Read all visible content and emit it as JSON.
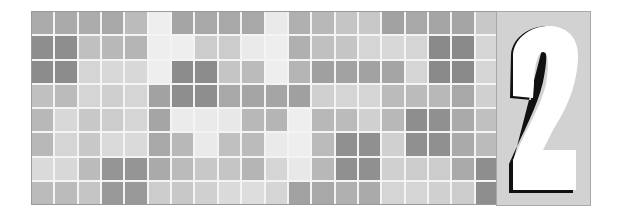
{
  "banner": {
    "chapter_number": "2",
    "colors": {
      "background": "#ffffff",
      "grid_gap": "#f4f4f4",
      "panel": "#d2d2d2",
      "numeral_fill": "#ffffff",
      "numeral_outline": "#111111"
    },
    "grid": {
      "columns": 20,
      "rows": 8,
      "cells": [
        [
          "#ababab",
          "#aaaaaa",
          "#acacac",
          "#a8a8a8",
          "#bbbbbb",
          "#eeeeee",
          "#a5a5a5",
          "#a8a8a8",
          "#a8a8a8",
          "#a8a8a8",
          "#eaeaea",
          "#b0b0b0",
          "#b8b8b8",
          "#c5c5c5",
          "#c8c8c8",
          "#a2a2a2",
          "#a8a8a8",
          "#a5a5a5",
          "#a5a5a5",
          "#c8c8c8"
        ],
        [
          "#8e8e8e",
          "#8e8e8e",
          "#c0c0c0",
          "#b8b8b8",
          "#b5b5b5",
          "#eeeeee",
          "#eeeeee",
          "#cccccc",
          "#cccccc",
          "#eaeaea",
          "#eeeeee",
          "#b0b0b0",
          "#c0c0c0",
          "#c5c5c5",
          "#d5d5d5",
          "#d8d8d8",
          "#d5d5d5",
          "#8a8a8a",
          "#8a8a8a",
          "#d5d5d5"
        ],
        [
          "#8c8c8c",
          "#8c8c8c",
          "#d5d5d5",
          "#d8d8d8",
          "#d8d8d8",
          "#eeeeee",
          "#8c8c8c",
          "#8c8c8c",
          "#c5c5c5",
          "#bbbbbb",
          "#eeeeee",
          "#b5b5b5",
          "#a0a0a0",
          "#a2a2a2",
          "#a2a2a2",
          "#a5a5a5",
          "#d5d5d5",
          "#8a8a8a",
          "#8a8a8a",
          "#d5d5d5"
        ],
        [
          "#c0c0c0",
          "#bbbbbb",
          "#d5d5d5",
          "#cfcfcf",
          "#d5d5d5",
          "#a2a2a2",
          "#8e8e8e",
          "#8e8e8e",
          "#a8a8a8",
          "#a5a5a5",
          "#a5a5a5",
          "#a0a0a0",
          "#d0d0d0",
          "#d5d5d5",
          "#d5d5d5",
          "#bbbbbb",
          "#bbbbbb",
          "#b8b8b8",
          "#a8a8a8",
          "#d0d0d0"
        ],
        [
          "#b8b8b8",
          "#d8d8d8",
          "#c8c8c8",
          "#cccccc",
          "#d5d5d5",
          "#a5a5a5",
          "#ebebeb",
          "#eaeaea",
          "#e8e8e8",
          "#b8b8b8",
          "#b5b5b5",
          "#eeeeee",
          "#b8b8b8",
          "#bbbbbb",
          "#d0d0d0",
          "#b8b8b8",
          "#8e8e8e",
          "#909090",
          "#aaaaaa",
          "#c0c0c0"
        ],
        [
          "#b8b8b8",
          "#d5d5d5",
          "#c8c8c8",
          "#dadada",
          "#dadada",
          "#a8a8a8",
          "#b8b8b8",
          "#eaeaea",
          "#c0c0c0",
          "#bbbbbb",
          "#eaeaea",
          "#eeeeee",
          "#bbbbbb",
          "#909090",
          "#909090",
          "#d0d0d0",
          "#909090",
          "#909090",
          "#aaaaaa",
          "#bbbbbb"
        ],
        [
          "#dadada",
          "#d8d8d8",
          "#bbbbbb",
          "#959595",
          "#959595",
          "#aaaaaa",
          "#bbbbbb",
          "#c8c8c8",
          "#c5c5c5",
          "#b5b5b5",
          "#d5d5d5",
          "#e8e8e8",
          "#b8b8b8",
          "#909090",
          "#909090",
          "#d0d0d0",
          "#cccccc",
          "#cccccc",
          "#aaaaaa",
          "#8e8e8e"
        ],
        [
          "#bbbbbb",
          "#bbbbbb",
          "#c5c5c5",
          "#999999",
          "#999999",
          "#cccccc",
          "#c8c8c8",
          "#d0d0d0",
          "#dadada",
          "#dddddd",
          "#d5d5d5",
          "#a2a2a2",
          "#a8a8a8",
          "#b0b0b0",
          "#aaaaaa",
          "#d5d5d5",
          "#d5d5d5",
          "#d0d0d0",
          "#cccccc",
          "#8e8e8e"
        ]
      ]
    }
  }
}
